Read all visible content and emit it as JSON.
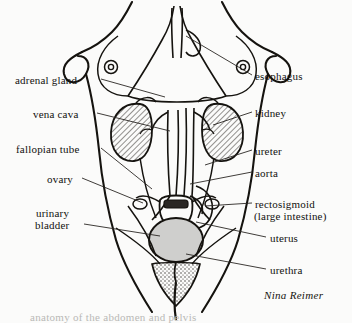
{
  "figure": {
    "artist_signature": "Nina Reimer",
    "partial_caption": "anatomy of the abdomen and pelvis",
    "background_color": "#fbfbfa",
    "ink_color": "#15130f",
    "leader_color": "#2a2724",
    "kidney_hatch_color": "#3a3733",
    "bladder_fill_color": "#cfcfcd"
  },
  "labels_left": [
    {
      "text": "adrenal gland",
      "x": 15,
      "y": 74,
      "anchor_x": 101,
      "anchor_y": 79,
      "tip_x": 165,
      "tip_y": 97
    },
    {
      "text": "vena cava",
      "x": 33,
      "y": 108,
      "anchor_x": 97,
      "anchor_y": 113,
      "tip_x": 170,
      "tip_y": 131
    },
    {
      "text": "fallopian tube",
      "x": 16,
      "y": 143,
      "anchor_x": 101,
      "anchor_y": 148,
      "tip_x": 152,
      "tip_y": 189
    },
    {
      "text": "ovary",
      "x": 47,
      "y": 173,
      "anchor_x": 82,
      "anchor_y": 178,
      "tip_x": 143,
      "tip_y": 203
    },
    {
      "text": "urinary",
      "x": 36,
      "y": 207,
      "anchor_x": null,
      "anchor_y": null,
      "tip_x": null,
      "tip_y": null
    },
    {
      "text": "bladder",
      "x": 35,
      "y": 219,
      "anchor_x": 84,
      "anchor_y": 224,
      "tip_x": 160,
      "tip_y": 236
    }
  ],
  "labels_right": [
    {
      "text": "esophagus",
      "x": 255,
      "y": 70,
      "anchor_x": 252,
      "anchor_y": 75,
      "tip_x": 186,
      "tip_y": 36
    },
    {
      "text": "kidney",
      "x": 255,
      "y": 107,
      "anchor_x": 252,
      "anchor_y": 112,
      "tip_x": 213,
      "tip_y": 125
    },
    {
      "text": "ureter",
      "x": 255,
      "y": 145,
      "anchor_x": 252,
      "anchor_y": 150,
      "tip_x": 205,
      "tip_y": 165
    },
    {
      "text": "aorta",
      "x": 255,
      "y": 167,
      "anchor_x": 252,
      "anchor_y": 172,
      "tip_x": 190,
      "tip_y": 184
    },
    {
      "text": "rectosigmoid",
      "x": 255,
      "y": 198,
      "anchor_x": 252,
      "anchor_y": 203,
      "tip_x": 205,
      "tip_y": 206
    },
    {
      "text": "(large intestine)",
      "x": 254,
      "y": 210,
      "anchor_x": null,
      "anchor_y": null,
      "tip_x": null,
      "tip_y": null
    },
    {
      "text": "uterus",
      "x": 270,
      "y": 232,
      "anchor_x": 266,
      "anchor_y": 237,
      "tip_x": 196,
      "tip_y": 222
    },
    {
      "text": "urethra",
      "x": 270,
      "y": 264,
      "anchor_x": 266,
      "anchor_y": 269,
      "tip_x": 186,
      "tip_y": 254
    }
  ],
  "signature": {
    "text": "Nina Reimer",
    "x": 264,
    "y": 289
  }
}
